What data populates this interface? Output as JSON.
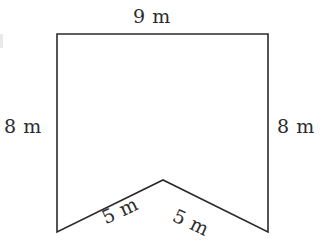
{
  "figure": {
    "canvas": {
      "width": 323,
      "height": 251
    },
    "stroke_color": "#2b2b2b",
    "fill_color": "#ffffff",
    "background_color": "#ffffff",
    "stroke_width": 1.6,
    "unit": "m",
    "vertices": [
      {
        "name": "top-left",
        "x": 57,
        "y": 34
      },
      {
        "name": "top-right",
        "x": 268,
        "y": 34
      },
      {
        "name": "bottom-right",
        "x": 268,
        "y": 232
      },
      {
        "name": "notch-apex",
        "x": 163,
        "y": 180
      },
      {
        "name": "bottom-left",
        "x": 57,
        "y": 232
      }
    ],
    "polygon_points": "57,34 268,34 268,232 163,180 57,232",
    "labels": {
      "top": "9 m",
      "left": "8 m",
      "right": "8 m",
      "bottom_left": "5 m",
      "bottom_right": "5 m"
    },
    "label_rotation_deg": {
      "top": 0,
      "left": 0,
      "right": 0,
      "bottom_left": -25,
      "bottom_right": 25
    }
  }
}
